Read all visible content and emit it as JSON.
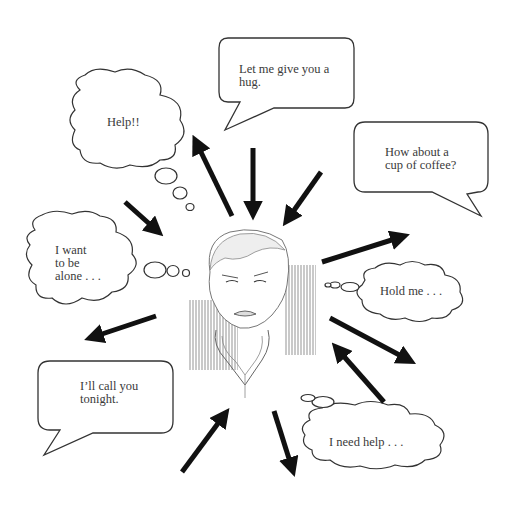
{
  "diagram": {
    "title": "",
    "center": {
      "description": "sketched distressed person",
      "icon": "person-sketch"
    },
    "speech_bubbles": [
      {
        "id": "hug",
        "text": "Let me give you a\nhug."
      },
      {
        "id": "coffee",
        "text": "How about a\ncup of coffee?"
      },
      {
        "id": "call",
        "text": "I’ll call you\ntonight."
      }
    ],
    "thought_clouds": [
      {
        "id": "help",
        "text": "Help!!"
      },
      {
        "id": "alone",
        "text": "I want\nto be\nalone . . ."
      },
      {
        "id": "hold",
        "text": "Hold me . . ."
      },
      {
        "id": "needhelp",
        "text": "I need help . . ."
      }
    ],
    "arrows": [
      {
        "from": "center",
        "to": "help"
      },
      {
        "from": "hug",
        "to": "center"
      },
      {
        "from": "coffee",
        "to": "center"
      },
      {
        "from": "help-thought",
        "to": "center"
      },
      {
        "from": "center",
        "to": "right"
      },
      {
        "from": "center",
        "to": "left-call"
      },
      {
        "from": "center",
        "to": "lower-right"
      },
      {
        "from": "needhelp",
        "to": "center"
      },
      {
        "from": "bottom-left",
        "to": "center"
      },
      {
        "from": "center",
        "to": "bottom"
      }
    ],
    "colors": {
      "ink": "#111111",
      "text": "#3a3a3a",
      "background": "#ffffff"
    }
  }
}
